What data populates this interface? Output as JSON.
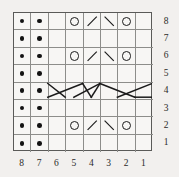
{
  "chart_data": {
    "type": "table",
    "rows": 8,
    "columns": 8,
    "row_labels": [
      "8",
      "7",
      "6",
      "5",
      "4",
      "3",
      "2",
      "1"
    ],
    "column_labels": [
      "8",
      "7",
      "6",
      "5",
      "4",
      "3",
      "2",
      "1"
    ],
    "row_label_position": "right",
    "column_label_position": "bottom",
    "legend": [
      {
        "symbol": "purl-dot",
        "glyph": "●",
        "meaning": "purl"
      },
      {
        "symbol": "yarn-over",
        "glyph": "O",
        "meaning": "yarn over"
      },
      {
        "symbol": "slash",
        "glyph": "/",
        "meaning": "knit 2 together"
      },
      {
        "symbol": "backslash",
        "glyph": "\\",
        "meaning": "slip slip knit"
      },
      {
        "symbol": "cable-cross",
        "glyph": "✕",
        "meaning": "cable cross"
      }
    ],
    "grid": [
      {
        "row": "8",
        "cells": [
          "purl-dot",
          "purl-dot",
          "empty",
          "yarn-over",
          "slash",
          "backslash",
          "yarn-over",
          "empty"
        ]
      },
      {
        "row": "7",
        "cells": [
          "purl-dot",
          "purl-dot",
          "empty",
          "empty",
          "empty",
          "empty",
          "empty",
          "empty"
        ]
      },
      {
        "row": "6",
        "cells": [
          "purl-dot",
          "purl-dot",
          "empty",
          "yarn-over",
          "slash",
          "backslash",
          "yarn-over",
          "empty"
        ]
      },
      {
        "row": "5",
        "cells": [
          "purl-dot",
          "purl-dot",
          "empty",
          "empty",
          "empty",
          "empty",
          "empty",
          "empty"
        ]
      },
      {
        "row": "4",
        "cells": [
          "purl-dot",
          "purl-dot",
          "cable",
          "cable",
          "cable",
          "cable",
          "cable",
          "cable"
        ]
      },
      {
        "row": "3",
        "cells": [
          "purl-dot",
          "purl-dot",
          "empty",
          "empty",
          "empty",
          "empty",
          "empty",
          "empty"
        ]
      },
      {
        "row": "2",
        "cells": [
          "purl-dot",
          "purl-dot",
          "empty",
          "yarn-over",
          "slash",
          "backslash",
          "yarn-over",
          "empty"
        ]
      },
      {
        "row": "1",
        "cells": [
          "purl-dot",
          "purl-dot",
          "empty",
          "empty",
          "empty",
          "empty",
          "empty",
          "empty"
        ]
      }
    ],
    "colors": {
      "background": "#f2f0ee",
      "cell_background": "#f7f6f4",
      "gridline": "#8d8d8a",
      "border": "#5a5a58",
      "symbol": "#1b1b1b",
      "label": "#2a2a28"
    },
    "grid_on": true
  }
}
